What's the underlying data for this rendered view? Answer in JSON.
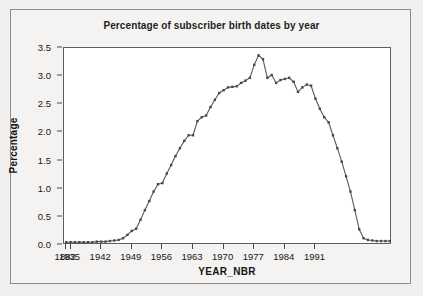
{
  "chart_data": {
    "type": "line",
    "title": "Percentage of subscriber birth dates by year",
    "xlabel": "YEAR_NBR",
    "ylabel": "Percentage",
    "ylim": [
      0.0,
      3.5
    ],
    "ytick_labels": [
      "0.0",
      "0.5",
      "1.0",
      "1.5",
      "2.0",
      "2.5",
      "3.0",
      "3.5"
    ],
    "ytick_values": [
      0.0,
      0.5,
      1.0,
      1.5,
      2.0,
      2.5,
      3.0,
      3.5
    ],
    "xtick_labels": [
      "1882",
      "1935",
      "1942",
      "1949",
      "1956",
      "1963",
      "1970",
      "1977",
      "1984",
      "1991"
    ],
    "grid": false,
    "legend": "none",
    "marker": "filled-square",
    "line_color": "#595959",
    "marker_color": "#4a4a4a",
    "categories": [
      "1882",
      "1935",
      "1936",
      "1937",
      "1938",
      "1939",
      "1940",
      "1941",
      "1942",
      "1943",
      "1944",
      "1945",
      "1946",
      "1947",
      "1948",
      "1949",
      "1950",
      "1951",
      "1952",
      "1953",
      "1954",
      "1955",
      "1956",
      "1957",
      "1958",
      "1959",
      "1960",
      "1961",
      "1962",
      "1963",
      "1964",
      "1965",
      "1966",
      "1967",
      "1968",
      "1969",
      "1970",
      "1971",
      "1972",
      "1973",
      "1974",
      "1975",
      "1976",
      "1977",
      "1978",
      "1979",
      "1980",
      "1981",
      "1982",
      "1983",
      "1984",
      "1985",
      "1986",
      "1987",
      "1988",
      "1989",
      "1990",
      "1991",
      "1992",
      "1993",
      "1994",
      "1995",
      "1996"
    ],
    "values": [
      0.05,
      0.05,
      0.05,
      0.05,
      0.05,
      0.05,
      0.05,
      0.06,
      0.06,
      0.06,
      0.07,
      0.08,
      0.09,
      0.12,
      0.18,
      0.25,
      0.29,
      0.45,
      0.62,
      0.78,
      0.95,
      1.08,
      1.1,
      1.27,
      1.42,
      1.58,
      1.72,
      1.85,
      1.95,
      1.95,
      2.2,
      2.27,
      2.3,
      2.45,
      2.58,
      2.7,
      2.75,
      2.8,
      2.81,
      2.82,
      2.88,
      2.92,
      2.97,
      3.2,
      3.37,
      3.3,
      2.97,
      3.02,
      2.88,
      2.93,
      2.95,
      2.97,
      2.9,
      2.72,
      2.8,
      2.85,
      2.83,
      2.6,
      2.42,
      2.27,
      2.18,
      1.95,
      1.72
    ],
    "values_tail": [
      1.48,
      1.22,
      0.95,
      0.62,
      0.28,
      0.12,
      0.09,
      0.08,
      0.07,
      0.07,
      0.07,
      0.07
    ],
    "peak": {
      "year": "1970",
      "value": 3.37
    },
    "baseline_early": 0.05,
    "baseline_late": 0.07
  },
  "colors": {
    "page_background": "#f1f0ee",
    "outer_border": "#8d8d8d",
    "plot_background": "#ffffff",
    "plot_border": "#5d5d5d",
    "text": "#171717",
    "series": "#595959"
  }
}
